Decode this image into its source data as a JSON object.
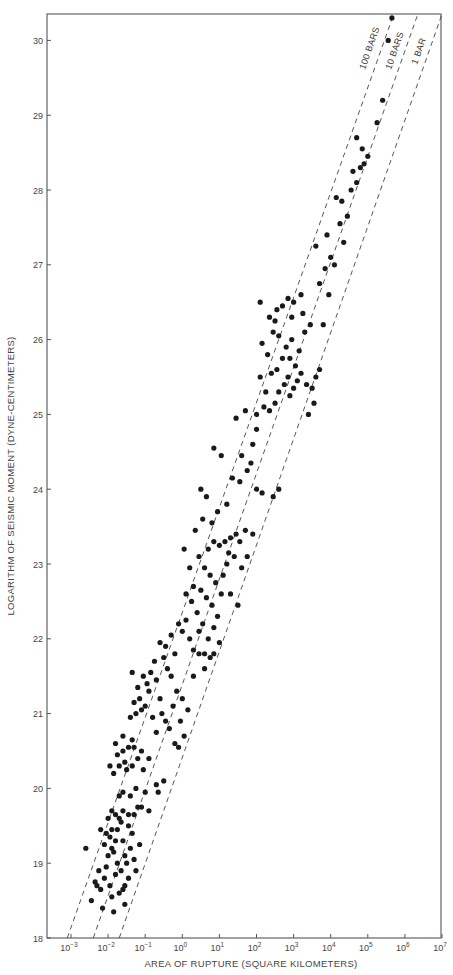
{
  "chart_data": {
    "type": "scatter",
    "title": "",
    "xlabel": "AREA OF RUPTURE (SQUARE KILOMETERS)",
    "ylabel": "LOGARITHM OF SEISMIC MOMENT (DYNE-CENTIMETERS)",
    "xscale": "log",
    "xlim_log10": [
      -3.65,
      7.0
    ],
    "ylim": [
      18,
      30.35
    ],
    "x_ticks": [
      {
        "exp": -3,
        "label": "10",
        "sup": "−3"
      },
      {
        "exp": -2,
        "label": "10",
        "sup": "−2"
      },
      {
        "exp": -1,
        "label": "10",
        "sup": "−1"
      },
      {
        "exp": 0,
        "label": "10",
        "sup": "0"
      },
      {
        "exp": 1,
        "label": "10",
        "sup": "1"
      },
      {
        "exp": 2,
        "label": "10",
        "sup": "2"
      },
      {
        "exp": 3,
        "label": "10",
        "sup": "3"
      },
      {
        "exp": 4,
        "label": "10",
        "sup": "4"
      },
      {
        "exp": 5,
        "label": "10",
        "sup": "5"
      },
      {
        "exp": 6,
        "label": "10",
        "sup": "6"
      },
      {
        "exp": 7,
        "label": "10",
        "sup": "7"
      }
    ],
    "y_ticks": [
      18,
      19,
      20,
      21,
      22,
      23,
      24,
      25,
      26,
      27,
      28,
      29,
      30
    ],
    "grid": false,
    "legend": null,
    "reference_lines": [
      {
        "label": "100 BARS",
        "stress_drop_bars": 100,
        "bottom_log10_area": -3.1,
        "top_log10_area": 5.7,
        "style": "dashed"
      },
      {
        "label": "10 BARS",
        "stress_drop_bars": 10,
        "bottom_log10_area": -2.4,
        "top_log10_area": 6.35,
        "style": "dashed"
      },
      {
        "label": "1 BAR",
        "stress_drop_bars": 1,
        "bottom_log10_area": -1.7,
        "top_log10_area": 7.0,
        "style": "dashed"
      }
    ],
    "series": [
      {
        "name": "earthquakes",
        "points_log10area_logmoment": [
          [
            -2.45,
            18.5
          ],
          [
            -2.3,
            18.7
          ],
          [
            -2.35,
            18.75
          ],
          [
            -2.2,
            18.65
          ],
          [
            -2.1,
            18.8
          ],
          [
            -2.25,
            18.9
          ],
          [
            -2.05,
            18.95
          ],
          [
            -1.95,
            18.7
          ],
          [
            -1.8,
            18.85
          ],
          [
            -1.7,
            18.6
          ],
          [
            -2.0,
            19.1
          ],
          [
            -1.9,
            19.2
          ],
          [
            -2.1,
            19.25
          ],
          [
            -1.8,
            19.3
          ],
          [
            -1.85,
            19.15
          ],
          [
            -1.95,
            19.35
          ],
          [
            -2.05,
            19.4
          ],
          [
            -1.75,
            19.45
          ],
          [
            -1.6,
            19.3
          ],
          [
            -1.55,
            19.1
          ],
          [
            -1.5,
            19.0
          ],
          [
            -1.4,
            19.2
          ],
          [
            -1.65,
            19.55
          ],
          [
            -1.7,
            19.6
          ],
          [
            -1.8,
            19.65
          ],
          [
            -1.9,
            19.7
          ],
          [
            -2.0,
            19.6
          ],
          [
            -1.6,
            19.7
          ],
          [
            -1.45,
            19.5
          ],
          [
            -1.35,
            19.4
          ],
          [
            -1.3,
            19.05
          ],
          [
            -1.25,
            18.9
          ],
          [
            -1.45,
            18.8
          ],
          [
            -1.55,
            18.7
          ],
          [
            -1.6,
            18.65
          ],
          [
            -2.6,
            19.2
          ],
          [
            -1.15,
            19.25
          ],
          [
            -1.2,
            19.75
          ],
          [
            -1.1,
            19.75
          ],
          [
            -2.15,
            18.4
          ],
          [
            -1.85,
            18.35
          ],
          [
            -1.55,
            18.45
          ],
          [
            -1.65,
            18.9
          ],
          [
            -1.75,
            19.0
          ],
          [
            -1.9,
            19.45
          ],
          [
            -1.7,
            19.9
          ],
          [
            -1.6,
            19.95
          ],
          [
            -1.3,
            19.65
          ],
          [
            -1.4,
            19.9
          ],
          [
            -1.25,
            20.0
          ],
          [
            -1.85,
            20.2
          ],
          [
            -1.7,
            20.3
          ],
          [
            -1.55,
            20.35
          ],
          [
            -1.75,
            20.45
          ],
          [
            -1.6,
            20.5
          ],
          [
            -1.45,
            20.55
          ],
          [
            -1.35,
            20.3
          ],
          [
            -1.2,
            20.4
          ],
          [
            -1.3,
            20.55
          ],
          [
            -1.5,
            20.25
          ],
          [
            -1.95,
            20.3
          ],
          [
            -1.8,
            20.6
          ],
          [
            -1.1,
            20.5
          ],
          [
            -0.7,
            20.05
          ],
          [
            -0.65,
            19.95
          ],
          [
            -0.5,
            20.1
          ],
          [
            -1.0,
            19.95
          ],
          [
            -0.9,
            19.7
          ],
          [
            -1.6,
            20.7
          ],
          [
            -1.35,
            20.65
          ],
          [
            -1.4,
            20.95
          ],
          [
            -1.25,
            21.0
          ],
          [
            -1.1,
            21.05
          ],
          [
            -1.3,
            21.15
          ],
          [
            -1.15,
            21.2
          ],
          [
            -1.0,
            21.1
          ],
          [
            -0.9,
            21.3
          ],
          [
            -0.95,
            21.4
          ],
          [
            -1.05,
            21.5
          ],
          [
            -0.85,
            21.55
          ],
          [
            -0.7,
            21.45
          ],
          [
            -0.6,
            21.2
          ],
          [
            -0.55,
            21.0
          ],
          [
            -0.45,
            20.9
          ],
          [
            -0.35,
            20.8
          ],
          [
            -0.25,
            21.1
          ],
          [
            -0.15,
            21.3
          ],
          [
            -0.4,
            21.6
          ],
          [
            -0.5,
            21.75
          ],
          [
            -1.2,
            21.35
          ],
          [
            -0.8,
            20.95
          ],
          [
            -0.7,
            20.75
          ],
          [
            -0.2,
            20.6
          ],
          [
            -0.1,
            20.55
          ],
          [
            0.05,
            20.7
          ],
          [
            -0.05,
            20.9
          ],
          [
            0.15,
            21.05
          ],
          [
            -0.3,
            21.5
          ],
          [
            -0.75,
            21.7
          ],
          [
            -1.35,
            21.55
          ],
          [
            -0.6,
            21.95
          ],
          [
            -0.45,
            21.9
          ],
          [
            -0.3,
            22.05
          ],
          [
            -0.1,
            22.2
          ],
          [
            0.0,
            22.1
          ],
          [
            0.1,
            22.25
          ],
          [
            0.2,
            22.0
          ],
          [
            0.3,
            21.85
          ],
          [
            0.45,
            21.8
          ],
          [
            0.6,
            21.8
          ],
          [
            0.75,
            21.75
          ],
          [
            0.85,
            21.8
          ],
          [
            0.7,
            22.0
          ],
          [
            0.55,
            22.2
          ],
          [
            0.4,
            22.35
          ],
          [
            0.25,
            22.5
          ],
          [
            0.1,
            22.6
          ],
          [
            0.3,
            22.7
          ],
          [
            0.5,
            22.65
          ],
          [
            0.65,
            22.55
          ],
          [
            0.8,
            22.45
          ],
          [
            0.95,
            22.3
          ],
          [
            1.05,
            22.6
          ],
          [
            0.9,
            22.75
          ],
          [
            0.75,
            22.85
          ],
          [
            0.6,
            22.95
          ],
          [
            0.45,
            23.1
          ],
          [
            0.7,
            23.2
          ],
          [
            0.85,
            23.3
          ],
          [
            1.0,
            23.25
          ],
          [
            1.15,
            23.3
          ],
          [
            1.3,
            23.35
          ],
          [
            1.45,
            23.4
          ],
          [
            1.55,
            23.3
          ],
          [
            1.7,
            23.45
          ],
          [
            1.4,
            23.1
          ],
          [
            1.2,
            23.0
          ],
          [
            1.1,
            22.85
          ],
          [
            1.3,
            22.6
          ],
          [
            1.5,
            22.45
          ],
          [
            1.75,
            23.1
          ],
          [
            1.9,
            23.4
          ],
          [
            0.2,
            22.95
          ],
          [
            0.05,
            23.2
          ],
          [
            0.35,
            23.45
          ],
          [
            0.55,
            23.6
          ],
          [
            0.8,
            23.55
          ],
          [
            0.95,
            23.7
          ],
          [
            0.65,
            23.9
          ],
          [
            0.5,
            24.0
          ],
          [
            1.2,
            23.8
          ],
          [
            1.35,
            24.15
          ],
          [
            1.55,
            24.1
          ],
          [
            1.75,
            24.25
          ],
          [
            1.6,
            24.45
          ],
          [
            1.9,
            24.6
          ],
          [
            2.0,
            24.0
          ],
          [
            2.15,
            23.95
          ],
          [
            2.45,
            23.9
          ],
          [
            2.6,
            24.0
          ],
          [
            1.05,
            24.45
          ],
          [
            0.85,
            24.55
          ],
          [
            1.45,
            24.95
          ],
          [
            1.7,
            25.05
          ],
          [
            2.0,
            25.0
          ],
          [
            2.2,
            25.1
          ],
          [
            2.35,
            25.05
          ],
          [
            2.5,
            25.15
          ],
          [
            2.6,
            25.3
          ],
          [
            2.75,
            25.4
          ],
          [
            2.85,
            25.5
          ],
          [
            2.9,
            25.25
          ],
          [
            3.0,
            25.35
          ],
          [
            3.1,
            25.45
          ],
          [
            3.2,
            25.55
          ],
          [
            3.35,
            25.4
          ],
          [
            3.5,
            25.35
          ],
          [
            3.6,
            25.5
          ],
          [
            3.7,
            25.6
          ],
          [
            3.05,
            25.65
          ],
          [
            2.7,
            25.75
          ],
          [
            2.55,
            25.6
          ],
          [
            2.4,
            25.55
          ],
          [
            2.3,
            25.8
          ],
          [
            2.15,
            25.95
          ],
          [
            2.45,
            26.1
          ],
          [
            2.6,
            26.05
          ],
          [
            2.8,
            25.9
          ],
          [
            2.95,
            26.0
          ],
          [
            3.15,
            25.85
          ],
          [
            3.3,
            26.1
          ],
          [
            3.45,
            26.2
          ],
          [
            2.35,
            26.3
          ],
          [
            2.55,
            26.4
          ],
          [
            2.7,
            26.45
          ],
          [
            2.85,
            26.55
          ],
          [
            3.0,
            26.5
          ],
          [
            3.2,
            26.6
          ],
          [
            2.5,
            26.25
          ],
          [
            2.95,
            26.3
          ],
          [
            3.7,
            26.75
          ],
          [
            3.85,
            26.95
          ],
          [
            4.1,
            27.0
          ],
          [
            4.0,
            27.1
          ],
          [
            3.6,
            27.25
          ],
          [
            3.9,
            27.4
          ],
          [
            4.25,
            27.55
          ],
          [
            4.45,
            27.65
          ],
          [
            4.3,
            27.85
          ],
          [
            4.15,
            27.9
          ],
          [
            4.55,
            28.0
          ],
          [
            4.7,
            28.1
          ],
          [
            4.6,
            28.25
          ],
          [
            4.8,
            28.3
          ],
          [
            4.9,
            28.35
          ],
          [
            5.0,
            28.45
          ],
          [
            4.85,
            28.55
          ],
          [
            4.7,
            28.7
          ],
          [
            5.25,
            28.9
          ],
          [
            5.4,
            29.2
          ],
          [
            5.65,
            30.3
          ],
          [
            5.55,
            30.0
          ],
          [
            2.1,
            25.5
          ],
          [
            2.25,
            25.3
          ],
          [
            3.4,
            25.0
          ],
          [
            3.55,
            25.15
          ],
          [
            2.0,
            24.8
          ],
          [
            1.85,
            24.35
          ],
          [
            0.3,
            21.5
          ],
          [
            0.0,
            21.2
          ],
          [
            -0.2,
            21.8
          ],
          [
            0.6,
            21.6
          ],
          [
            1.0,
            21.95
          ],
          [
            -1.9,
            18.55
          ],
          [
            -2.2,
            19.45
          ],
          [
            -1.45,
            19.65
          ],
          [
            -1.05,
            20.25
          ],
          [
            -0.9,
            20.4
          ],
          [
            0.45,
            22.1
          ],
          [
            0.85,
            22.15
          ],
          [
            1.25,
            23.15
          ],
          [
            1.6,
            22.95
          ],
          [
            2.9,
            25.75
          ],
          [
            3.25,
            26.35
          ],
          [
            3.8,
            26.2
          ],
          [
            2.1,
            26.5
          ],
          [
            4.35,
            27.3
          ],
          [
            3.95,
            26.6
          ]
        ]
      }
    ]
  },
  "axes": {
    "xlabel": "AREA OF RUPTURE (SQUARE KILOMETERS)",
    "ylabel": "LOGARITHM OF SEISMIC MOMENT (DYNE-CENTIMETERS)"
  },
  "line_labels": {
    "l100": "100 BARS",
    "l10": "10 BARS",
    "l1": "1 BAR"
  }
}
